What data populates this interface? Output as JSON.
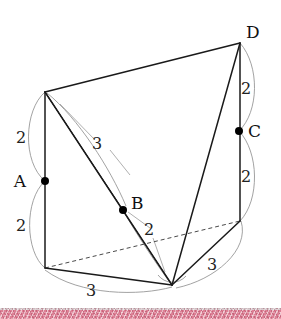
{
  "figure": {
    "background_color": "#ffffff",
    "points": [
      {
        "id": "P_topleft",
        "label": "",
        "x": 45,
        "y": 92,
        "show_dot": false
      },
      {
        "id": "A",
        "label": "A",
        "x": 45,
        "y": 181,
        "show_dot": true,
        "label_x": 26,
        "label_y": 187
      },
      {
        "id": "P_botleft",
        "label": "",
        "x": 45,
        "y": 268,
        "show_dot": false
      },
      {
        "id": "B",
        "label": "B",
        "x": 123,
        "y": 210,
        "show_dot": true,
        "label_x": 131,
        "label_y": 209
      },
      {
        "id": "P_apex",
        "label": "",
        "x": 172,
        "y": 285,
        "show_dot": false
      },
      {
        "id": "D",
        "label": "D",
        "x": 240,
        "y": 43,
        "show_dot": false,
        "label_x": 246,
        "label_y": 38
      },
      {
        "id": "C",
        "label": "C",
        "x": 239,
        "y": 131,
        "show_dot": true,
        "label_x": 248,
        "label_y": 137
      },
      {
        "id": "P_botright",
        "label": "",
        "x": 240,
        "y": 221,
        "show_dot": false
      }
    ],
    "length_labels": [
      {
        "id": "len-top-left",
        "text": "2",
        "x": 21,
        "y": 143
      },
      {
        "id": "len-bottom-left",
        "text": "2",
        "x": 21,
        "y": 231
      },
      {
        "id": "len-diagonal",
        "text": "3",
        "x": 97,
        "y": 149
      },
      {
        "id": "len-b-apex",
        "text": "2",
        "x": 149,
        "y": 235
      },
      {
        "id": "len-top-right",
        "text": "2",
        "x": 246,
        "y": 94
      },
      {
        "id": "len-mid-right",
        "text": "2",
        "x": 246,
        "y": 182
      },
      {
        "id": "len-base-right",
        "text": "3",
        "x": 212,
        "y": 270
      },
      {
        "id": "len-base-front",
        "text": "3",
        "x": 91,
        "y": 296
      }
    ],
    "bottom_band": {
      "base_color": "#dd8095",
      "top": 308,
      "height": 11
    }
  }
}
